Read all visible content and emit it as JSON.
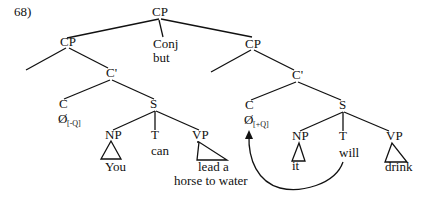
{
  "example_number": "68)",
  "nodes": {
    "root_cp": "CP",
    "conj": "Conj",
    "conj_word": "but",
    "left_cp": "CP",
    "left_cbar": "C'",
    "left_c": "C",
    "left_c_null": "Ø",
    "left_c_feature": "[-Q]",
    "left_s": "S",
    "left_np": "NP",
    "left_np_word": "You",
    "left_t": "T",
    "left_t_word": "can",
    "left_vp": "VP",
    "left_vp_line1": "lead a",
    "left_vp_line2": "horse to water",
    "right_cp": "CP",
    "right_cbar": "C'",
    "right_c": "C",
    "right_c_null": "Ø",
    "right_c_feature": "[+Q]",
    "right_s": "S",
    "right_np": "NP",
    "right_np_word": "it",
    "right_t": "T",
    "right_t_word": "will",
    "right_vp": "VP",
    "right_vp_word": "drink"
  },
  "movement": {
    "from": "T (will)",
    "to": "C Ø[+Q]",
    "type": "T-to-C movement arrow"
  }
}
